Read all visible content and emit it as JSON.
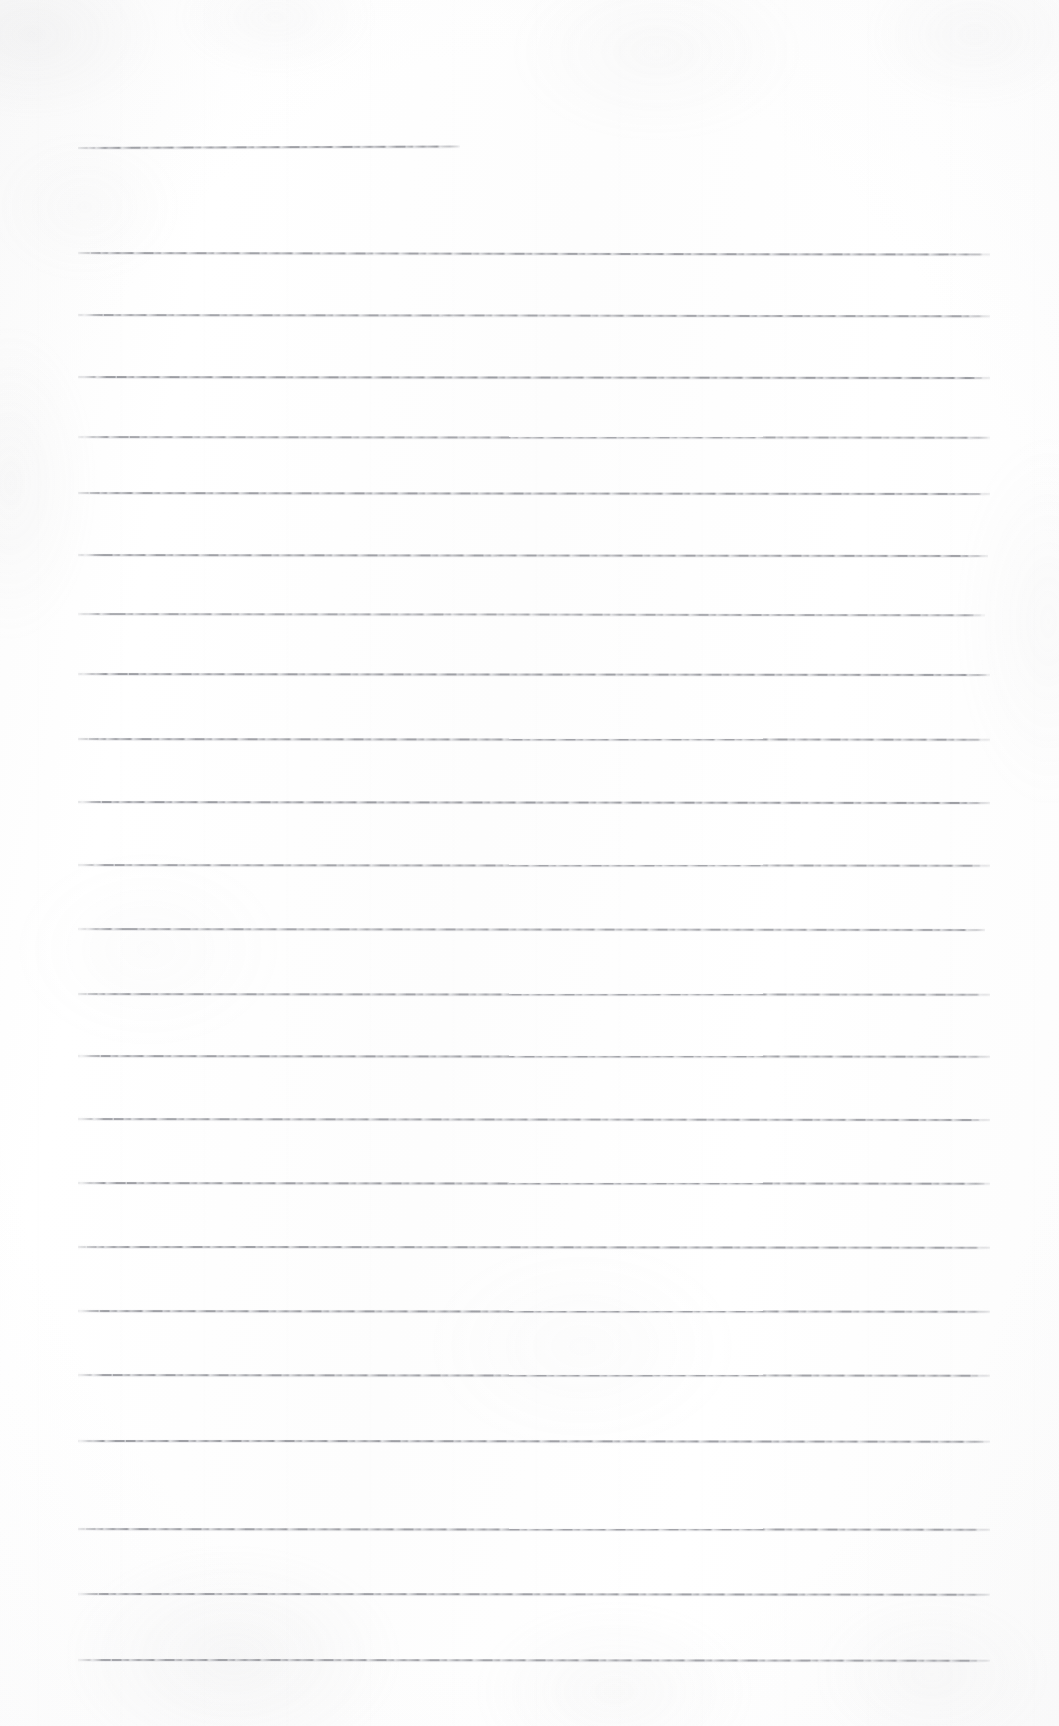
{
  "document": {
    "kind": "scanned-lined-paper",
    "title": "Blank ruled notebook page (scan)",
    "page_width": 1059,
    "page_height": 1726,
    "text_content": "",
    "written_text_present": false,
    "paper_color": "#fdfdfd",
    "rule_color": "#6c6e76",
    "rule_thickness_px": 1,
    "margin_left_px": 78,
    "margin_right_px": 990,
    "line_spacing_px": 65.3
  },
  "rules": [
    {
      "id": "rule-01",
      "y": 147,
      "x_start": 78,
      "x_end": 460,
      "tilt_deg": -0.22,
      "opacity": 0.72,
      "short": true
    },
    {
      "id": "rule-02",
      "y": 252,
      "x_start": 78,
      "x_end": 990,
      "tilt_deg": 0.1,
      "opacity": 0.7,
      "short": false
    },
    {
      "id": "rule-03",
      "y": 314,
      "x_start": 78,
      "x_end": 990,
      "tilt_deg": 0.08,
      "opacity": 0.68,
      "short": false
    },
    {
      "id": "rule-04",
      "y": 376,
      "x_start": 78,
      "x_end": 990,
      "tilt_deg": 0.06,
      "opacity": 0.74,
      "short": false
    },
    {
      "id": "rule-05",
      "y": 436,
      "x_start": 78,
      "x_end": 990,
      "tilt_deg": 0.05,
      "opacity": 0.66,
      "short": false
    },
    {
      "id": "rule-06",
      "y": 492,
      "x_start": 78,
      "x_end": 990,
      "tilt_deg": 0.06,
      "opacity": 0.72,
      "short": false
    },
    {
      "id": "rule-07",
      "y": 554,
      "x_start": 78,
      "x_end": 988,
      "tilt_deg": 0.07,
      "opacity": 0.7,
      "short": false
    },
    {
      "id": "rule-08",
      "y": 613,
      "x_start": 78,
      "x_end": 985,
      "tilt_deg": 0.08,
      "opacity": 0.64,
      "short": false
    },
    {
      "id": "rule-09",
      "y": 673,
      "x_start": 78,
      "x_end": 990,
      "tilt_deg": 0.06,
      "opacity": 0.72,
      "short": false
    },
    {
      "id": "rule-10",
      "y": 738,
      "x_start": 78,
      "x_end": 990,
      "tilt_deg": 0.05,
      "opacity": 0.7,
      "short": false
    },
    {
      "id": "rule-11",
      "y": 801,
      "x_start": 78,
      "x_end": 990,
      "tilt_deg": 0.06,
      "opacity": 0.74,
      "short": false
    },
    {
      "id": "rule-12",
      "y": 864,
      "x_start": 78,
      "x_end": 990,
      "tilt_deg": 0.05,
      "opacity": 0.68,
      "short": false
    },
    {
      "id": "rule-13",
      "y": 928,
      "x_start": 78,
      "x_end": 985,
      "tilt_deg": 0.06,
      "opacity": 0.66,
      "short": false
    },
    {
      "id": "rule-14",
      "y": 993,
      "x_start": 78,
      "x_end": 990,
      "tilt_deg": 0.05,
      "opacity": 0.68,
      "short": false
    },
    {
      "id": "rule-15",
      "y": 1055,
      "x_start": 78,
      "x_end": 990,
      "tilt_deg": 0.05,
      "opacity": 0.7,
      "short": false
    },
    {
      "id": "rule-16",
      "y": 1118,
      "x_start": 78,
      "x_end": 990,
      "tilt_deg": 0.06,
      "opacity": 0.68,
      "short": false
    },
    {
      "id": "rule-17",
      "y": 1182,
      "x_start": 78,
      "x_end": 990,
      "tilt_deg": 0.05,
      "opacity": 0.72,
      "short": false
    },
    {
      "id": "rule-18",
      "y": 1246,
      "x_start": 78,
      "x_end": 990,
      "tilt_deg": 0.04,
      "opacity": 0.7,
      "short": false
    },
    {
      "id": "rule-19",
      "y": 1310,
      "x_start": 78,
      "x_end": 990,
      "tilt_deg": 0.05,
      "opacity": 0.72,
      "short": false
    },
    {
      "id": "rule-20",
      "y": 1374,
      "x_start": 78,
      "x_end": 990,
      "tilt_deg": 0.05,
      "opacity": 0.7,
      "short": false
    },
    {
      "id": "rule-21",
      "y": 1440,
      "x_start": 78,
      "x_end": 990,
      "tilt_deg": 0.04,
      "opacity": 0.72,
      "short": false
    },
    {
      "id": "rule-22",
      "y": 1528,
      "x_start": 78,
      "x_end": 990,
      "tilt_deg": 0.05,
      "opacity": 0.7,
      "short": false
    },
    {
      "id": "rule-23",
      "y": 1593,
      "x_start": 78,
      "x_end": 990,
      "tilt_deg": 0.04,
      "opacity": 0.7,
      "short": false
    },
    {
      "id": "rule-24",
      "y": 1659,
      "x_start": 78,
      "x_end": 990,
      "tilt_deg": 0.04,
      "opacity": 0.68,
      "short": false
    }
  ]
}
